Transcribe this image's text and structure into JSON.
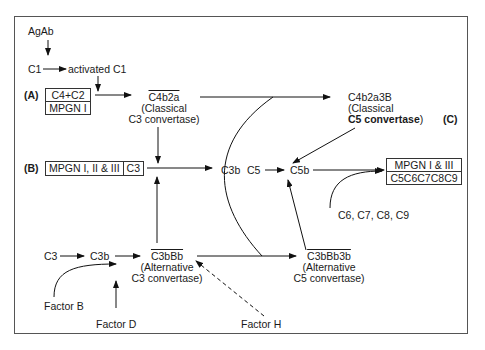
{
  "diagram": {
    "title": "",
    "labels": {
      "A": "(A)",
      "B": "(B)",
      "C": "(C)"
    },
    "nodes": {
      "agab": "AgAb",
      "c1": "C1",
      "activated_c1": "activated C1",
      "box_a": {
        "top": "C4+C2",
        "bottom": "MPGN I"
      },
      "c4b2a": "C4b2a",
      "c4b2a_note_1": "(Classical",
      "c4b2a_note_2": "C3 convertase)",
      "c4b2a3b": "C4b2a3B",
      "c4b2a3b_note_1": "(Classical",
      "c4b2a3b_note_2_bold": "C5 convertase",
      "c4b2a3b_note_2_end": ")",
      "box_b": {
        "left": "MPGN I, II & III",
        "right": "C3"
      },
      "c3b_mid": "C3b",
      "c5": "C5",
      "c5b": "C5b",
      "box_mac": {
        "top": "MPGN I & III",
        "bottom": "C5C6C7C8C9"
      },
      "c6_c9": "C6, C7, C8, C9",
      "c3_alt": "C3",
      "c3b_alt": "C3b",
      "c3bbb": "C3bBb",
      "c3bbb_note_1": "(Alternative",
      "c3bbb_note_2": "C3 convertase)",
      "c3bbb3b": "C3bBb3b",
      "c3bbb3b_note_1": "(Alternative",
      "c3bbb3b_note_2": "C5 convertase)",
      "factor_b": "Factor B",
      "factor_d": "Factor D",
      "factor_h": "Factor H"
    },
    "colors": {
      "line": "#111111",
      "frame": "#555555",
      "background": "#ffffff"
    }
  }
}
